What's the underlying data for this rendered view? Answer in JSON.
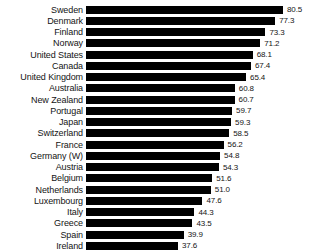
{
  "chart_data": {
    "type": "bar",
    "orientation": "horizontal",
    "title": "",
    "subtitle": "",
    "xlabel": "",
    "ylabel": "",
    "xlim": [
      0,
      80.5
    ],
    "grid": false,
    "legend": null,
    "value_labels_shown": true,
    "bar_color": "#000000",
    "background_color": "#ffffff",
    "text_color": "#141414",
    "sorted": "descending",
    "categories": [
      "Sweden",
      "Denmark",
      "Finland",
      "Norway",
      "United States",
      "Canada",
      "United Kingdom",
      "Australia",
      "New Zealand",
      "Portugal",
      "Japan",
      "Switzerland",
      "France",
      "Germany (W)",
      "Austria",
      "Belgium",
      "Netherlands",
      "Luxembourg",
      "Italy",
      "Greece",
      "Spain",
      "Ireland"
    ],
    "values": [
      80.5,
      77.3,
      73.3,
      71.2,
      68.1,
      67.4,
      65.4,
      60.8,
      60.7,
      59.7,
      59.3,
      58.5,
      56.2,
      54.8,
      54.3,
      51.6,
      51.0,
      47.6,
      44.3,
      43.5,
      39.9,
      37.6
    ],
    "value_labels": [
      "80.5",
      "77.3",
      "73.3",
      "71.2",
      "68.1",
      "67.4",
      "65.4",
      "60.8",
      "60.7",
      "59.7",
      "59.3",
      "58.5",
      "56.2",
      "54.8",
      "54.3",
      "51.6",
      "51.0",
      "47.6",
      "44.3",
      "43.5",
      "39.9",
      "37.6"
    ]
  }
}
